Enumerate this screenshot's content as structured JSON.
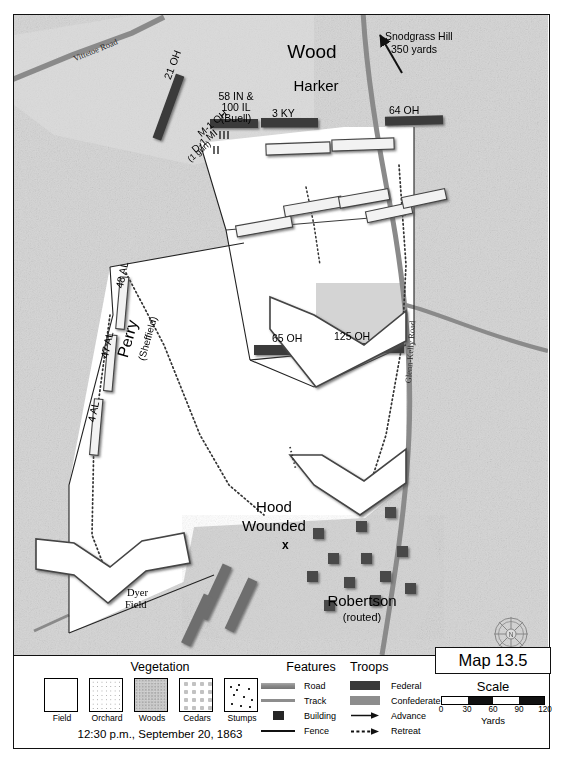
{
  "map": {
    "title": "Map 13.5",
    "datetime": "12:30 p.m., September 20, 1863",
    "compass_letter": "N",
    "annotations": [
      {
        "name": "snodgrass-hill",
        "line1": "Snodgrass Hill",
        "line2": "350 yards"
      }
    ],
    "place_labels": [
      {
        "name": "wood-division",
        "text": "Wood"
      },
      {
        "name": "harker-brigade",
        "text": "Harker"
      },
      {
        "name": "perry-brigade",
        "line1": "Perry",
        "line2": "(Sheffield)"
      },
      {
        "name": "robertson-brigade",
        "line1": "Robertson",
        "line2": "(routed)"
      },
      {
        "name": "hood-wounded",
        "line1": "Hood",
        "line2": "Wounded"
      },
      {
        "name": "dyer-field",
        "line1": "Dyer",
        "line2": "Field"
      }
    ],
    "roads": [
      {
        "name": "vittetoe-road",
        "text": "Vittetoe Road"
      },
      {
        "name": "glenn-kelly-road",
        "text": "Glenn-Kelly Road"
      }
    ],
    "federal_units": [
      {
        "name": "unit-21-oh",
        "text": "21 OH"
      },
      {
        "name": "unit-58in-100il",
        "line1": "58 IN &",
        "line2": "100 IL",
        "line3": "(Buell)"
      },
      {
        "name": "unit-3-ky",
        "text": "3 KY"
      },
      {
        "name": "unit-64-oh",
        "text": "64 OH"
      },
      {
        "name": "unit-65-oh",
        "text": "65 OH"
      },
      {
        "name": "unit-125-oh",
        "text": "125 OH"
      },
      {
        "name": "battery-m-1-oh",
        "text": "M-1 OH"
      },
      {
        "name": "battery-d-1-mi",
        "line1": "D-1 MI",
        "line2": "(1 gun)"
      }
    ],
    "confederate_units": [
      {
        "name": "unit-48-al",
        "text": "48 AL"
      },
      {
        "name": "unit-47-al",
        "text": "47 AL"
      },
      {
        "name": "unit-4-al",
        "text": "4 AL"
      }
    ],
    "casualty_marker": "x"
  },
  "legend": {
    "vegetation": {
      "title": "Vegetation",
      "items": [
        {
          "name": "veg-field",
          "label": "Field"
        },
        {
          "name": "veg-orchard",
          "label": "Orchard"
        },
        {
          "name": "veg-woods",
          "label": "Woods"
        },
        {
          "name": "veg-cedars",
          "label": "Cedars"
        },
        {
          "name": "veg-stumps",
          "label": "Stumps"
        }
      ]
    },
    "features": {
      "title": "Features",
      "items": [
        {
          "name": "feat-road",
          "label": "Road"
        },
        {
          "name": "feat-track",
          "label": "Track"
        },
        {
          "name": "feat-building",
          "label": "Building"
        },
        {
          "name": "feat-fence",
          "label": "Fence"
        }
      ]
    },
    "troops": {
      "title": "Troops",
      "items": [
        {
          "name": "troop-federal",
          "label": "Federal"
        },
        {
          "name": "troop-confederate",
          "label": "Confederate"
        },
        {
          "name": "troop-advance",
          "label": "Advance"
        },
        {
          "name": "troop-retreat",
          "label": "Retreat"
        }
      ]
    }
  },
  "scale": {
    "title": "Scale",
    "unit": "Yards",
    "ticks": [
      "0",
      "30",
      "60",
      "90",
      "120"
    ]
  },
  "colors": {
    "federal": "#3a3a3a",
    "confederate": "#8d8d8d",
    "road": "#8f8f8f",
    "field": "#ffffff",
    "woods": "#cfcfcf"
  }
}
